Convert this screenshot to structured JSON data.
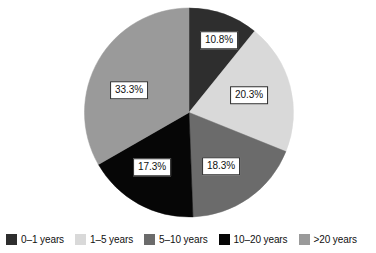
{
  "chart_data": {
    "type": "pie",
    "title": "",
    "categories": [
      "0–1 years",
      "1–5 years",
      "5–10 years",
      "10–20 years",
      ">20 years"
    ],
    "values": [
      10.8,
      20.3,
      18.3,
      17.3,
      33.3
    ],
    "value_labels": [
      "10.8%",
      "20.3%",
      "18.3%",
      "17.3%",
      "33.3%"
    ],
    "colors": [
      "#2e2e2e",
      "#d9d9d9",
      "#6b6b6b",
      "#060606",
      "#9a9a9a"
    ],
    "start_angle_deg": 0,
    "direction": "clockwise",
    "legend_position": "bottom",
    "grid": false,
    "units": "percent",
    "slices": [
      {
        "label": "0–1 years",
        "value": 10.8,
        "value_label": "10.8%",
        "color": "#2e2e2e",
        "label_x": 219,
        "label_y": 40
      },
      {
        "label": "1–5 years",
        "value": 20.3,
        "value_label": "20.3%",
        "color": "#d9d9d9",
        "label_x": 249,
        "label_y": 95
      },
      {
        "label": "5–10 years",
        "value": 18.3,
        "value_label": "18.3%",
        "color": "#6b6b6b",
        "label_x": 221,
        "label_y": 166
      },
      {
        "label": "10–20 years",
        "value": 17.3,
        "value_label": "17.3%",
        "color": "#060606",
        "label_x": 152,
        "label_y": 167
      },
      {
        "label": ">20 years",
        "value": 33.3,
        "value_label": "33.3%",
        "color": "#9a9a9a",
        "label_x": 129,
        "label_y": 90
      }
    ]
  },
  "legend": {
    "items": [
      {
        "label": "0–1 years",
        "color": "#2e2e2e"
      },
      {
        "label": "1–5 years",
        "color": "#d9d9d9"
      },
      {
        "label": "5–10 years",
        "color": "#6b6b6b"
      },
      {
        "label": "10–20 years",
        "color": "#060606"
      },
      {
        "label": ">20 years",
        "color": "#9a9a9a"
      }
    ]
  }
}
